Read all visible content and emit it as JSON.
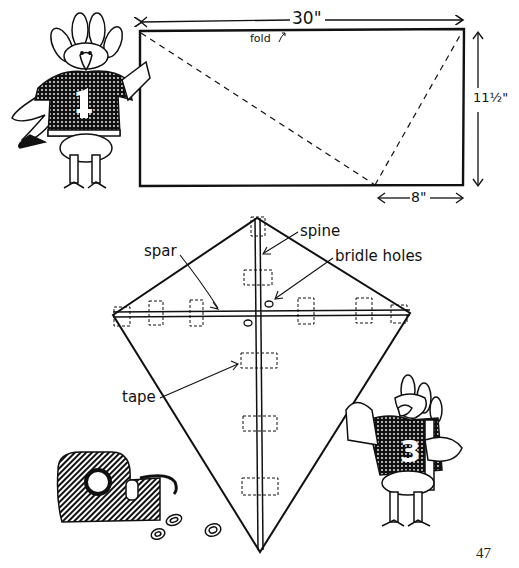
{
  "page": {
    "number": "47"
  },
  "step1": {
    "title": "Paper rectangle with fold lines",
    "width_label": "30\"",
    "height_label": "11½\"",
    "offset_label": "8\"",
    "fold_label": "fold",
    "fold_icon": "curved-arrow-up-right"
  },
  "step2": {
    "title": "Assembled kite",
    "labels": {
      "spar": "spar",
      "spine": "spine",
      "bridle_holes": "bridle holes",
      "tape": "tape"
    }
  },
  "characters": [
    {
      "name": "turkey-player-1",
      "jersey_number": "1"
    },
    {
      "name": "turkey-player-3",
      "jersey_number": "3"
    }
  ],
  "colors": {
    "ink": "#111111",
    "paper": "#ffffff"
  }
}
